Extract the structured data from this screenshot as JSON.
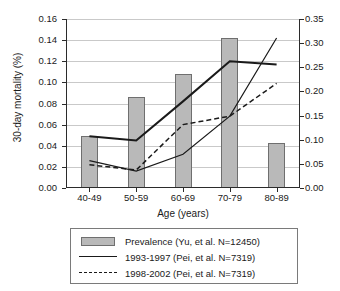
{
  "chart_data": {
    "type": "bar",
    "title": "",
    "subtitle": "",
    "xlabel": "Age (years)",
    "ylabel": "30-day mortality (%)",
    "ylabel_right": "",
    "categories": [
      "40-49",
      "50-59",
      "60-69",
      "70-79",
      "80-89"
    ],
    "ylim": [
      0.0,
      0.16
    ],
    "ylim_right": [
      0.0,
      0.35
    ],
    "yticks": [
      "0.00",
      "0.02",
      "0.04",
      "0.06",
      "0.08",
      "0.10",
      "0.12",
      "0.14",
      "0.16"
    ],
    "yticks_right": [
      "0.00",
      "0.05",
      "0.10",
      "0.15",
      "0.20",
      "0.25",
      "0.30",
      "0.35"
    ],
    "grid": true,
    "legend_position": "below",
    "series": [
      {
        "name": "Prevalence (Yu, et al. N=12450)",
        "type": "bar",
        "axis": "right",
        "values": [
          0.107,
          0.187,
          0.235,
          0.309,
          0.094
        ],
        "values_left_scale": [
          0.049,
          0.086,
          0.108,
          0.142,
          0.043
        ],
        "color": "#b9b9b9"
      },
      {
        "name": "1993-1997 (Pei, et al. N=7319)",
        "type": "line",
        "style": "solid",
        "axis": "left",
        "values": [
          0.049,
          0.045,
          0.082,
          0.12,
          0.117
        ],
        "color": "#1a1a1a"
      },
      {
        "name": "1998-2002 (Pei, et al. N=7319)",
        "type": "line",
        "style": "dashed",
        "axis": "left",
        "values": [
          0.022,
          0.017,
          0.06,
          0.068,
          0.099
        ],
        "color": "#1a1a1a"
      },
      {
        "name": "1993-1997 thin",
        "type": "line",
        "style": "solid",
        "axis": "left",
        "values": [
          0.026,
          0.016,
          0.032,
          0.068,
          0.142
        ],
        "color": "#1a1a1a"
      }
    ]
  },
  "legend": {
    "items": [
      {
        "key": "bar",
        "label": "Prevalence (Yu, et al. N=12450)"
      },
      {
        "key": "solid",
        "label": "1993-1997 (Pei, et al. N=7319)"
      },
      {
        "key": "dashed",
        "label": "1998-2002 (Pei, et al. N=7319)"
      }
    ]
  },
  "axes": {
    "x_label": "Age (years)",
    "y_left_label": "30-day mortality (%)"
  }
}
